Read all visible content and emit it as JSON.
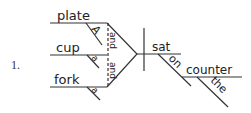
{
  "item_number": "1.",
  "sentence_diagram": {
    "compound_subject": [
      {
        "noun": "plate",
        "modifier": "A"
      },
      {
        "noun": "cup",
        "modifier": "a"
      },
      {
        "noun": "fork",
        "modifier": "a"
      }
    ],
    "conjunctions": [
      "and",
      "and"
    ],
    "verb": "sat",
    "preposition": "on",
    "object_of_preposition": "counter",
    "object_modifier": "the"
  },
  "colors": {
    "ink": "#333333",
    "background": "#ffffff"
  }
}
